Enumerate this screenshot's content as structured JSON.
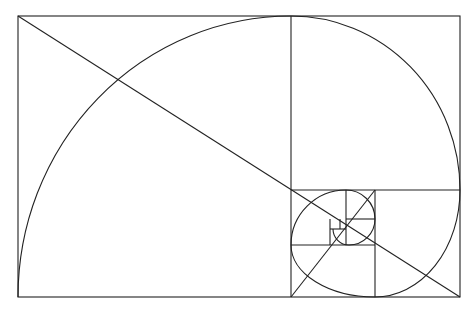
{
  "diagram": {
    "stroke_color": "#222222",
    "background_color": "#ffffff",
    "outer_rect": {
      "x": 18,
      "y": 16,
      "w": 442,
      "h": 281
    },
    "squares": [
      {
        "x": 18,
        "y": 16,
        "size": 273
      },
      {
        "x": 291,
        "y": 16,
        "size": 169
      },
      {
        "x": 375,
        "y": 190,
        "size": 85
      },
      {
        "x": 291,
        "y": 245,
        "size": 84
      },
      {
        "x": 291,
        "y": 190,
        "size": 55
      },
      {
        "x": 346,
        "y": 190,
        "size": 29
      },
      {
        "x": 346,
        "y": 219,
        "size": 26
      },
      {
        "x": 330,
        "y": 219,
        "size": 16
      }
    ],
    "diagonals": [
      {
        "x1": 18,
        "y1": 16,
        "x2": 460,
        "y2": 297
      },
      {
        "x1": 291,
        "y1": 297,
        "x2": 375,
        "y2": 190
      }
    ]
  }
}
